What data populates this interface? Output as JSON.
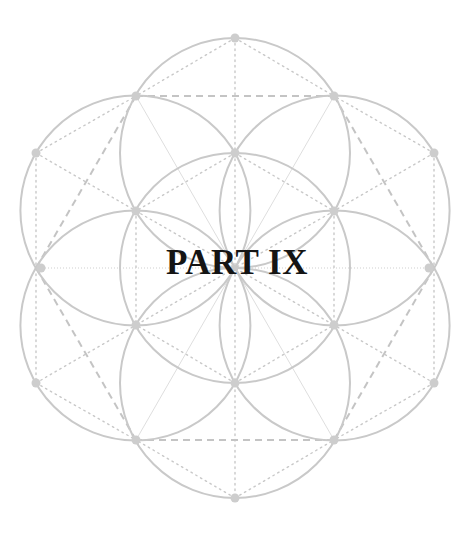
{
  "page": {
    "title": "PART IX"
  },
  "figure": {
    "name": "seed-of-life-geometry",
    "center": [
      235,
      268
    ],
    "radius": 115,
    "colors": {
      "circle": "#c9c9c9",
      "dot": "#cdcdcd",
      "dashed": "#c4c4c4",
      "dotted": "#c6c6c6",
      "thin": "#dddddd",
      "text": "#141414"
    }
  }
}
